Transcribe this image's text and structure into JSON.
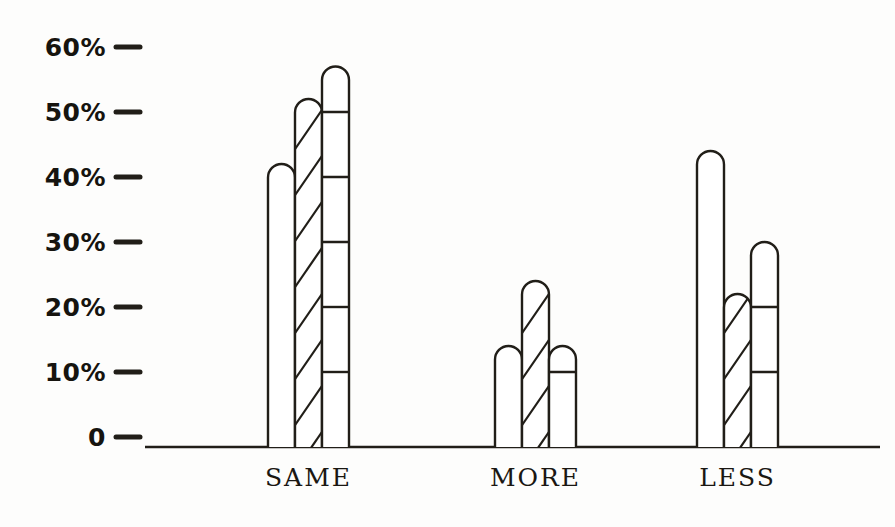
{
  "chart_data": {
    "type": "bar",
    "title": "",
    "subtitle": "",
    "xlabel": "",
    "ylabel": "",
    "categories": [
      "SAME",
      "MORE",
      "LESS"
    ],
    "series": [
      {
        "name": "series-1-plain",
        "pattern": "plain",
        "values": [
          42,
          14,
          44
        ]
      },
      {
        "name": "series-2-hatch",
        "pattern": "diagonal",
        "values": [
          52,
          24,
          22
        ]
      },
      {
        "name": "series-3-ladder",
        "pattern": "horizontal",
        "values": [
          57,
          14,
          30
        ]
      }
    ],
    "ylim": [
      0,
      62
    ],
    "ytick_values": [
      0,
      10,
      20,
      30,
      40,
      50,
      60
    ],
    "ytick_labels": [
      "0",
      "10%",
      "20%",
      "30%",
      "40%",
      "50%",
      "60%"
    ],
    "grid": false,
    "legend": "none",
    "axis_line_color": "#211e18",
    "bar_line_color": "#211e18"
  },
  "axis": {
    "y_labels": [
      {
        "text": "60%",
        "value": 60
      },
      {
        "text": "50%",
        "value": 50
      },
      {
        "text": "40%",
        "value": 40
      },
      {
        "text": "30%",
        "value": 30
      },
      {
        "text": "20%",
        "value": 20
      },
      {
        "text": "10%",
        "value": 10
      },
      {
        "text": "0",
        "value": 0
      }
    ],
    "x_labels": [
      {
        "text": "SAME"
      },
      {
        "text": "MORE"
      },
      {
        "text": "LESS"
      }
    ]
  }
}
